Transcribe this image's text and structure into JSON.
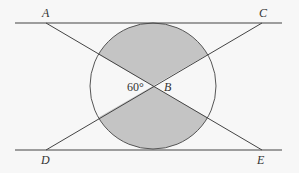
{
  "figure": {
    "labels": {
      "A": "A",
      "B": "B",
      "C": "C",
      "D": "D",
      "E": "E"
    },
    "angle_label": "60°",
    "colors": {
      "line": "#444444",
      "shade": "#c4c4c4",
      "background": "#f7f7f7"
    }
  }
}
